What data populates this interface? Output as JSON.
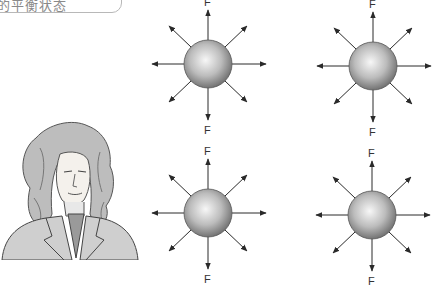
{
  "title_label": {
    "text": "的平衡状态",
    "cropped": true
  },
  "portrait": {
    "subject": "man-with-long-curly-wig-portrait",
    "style": "grayscale sketch"
  },
  "diagrams": [
    {
      "id": "sphere-top-left",
      "cx": 208,
      "cy": 64,
      "top_label": "F",
      "bottom_label": "F",
      "arrows": 8
    },
    {
      "id": "sphere-top-right",
      "cx": 373,
      "cy": 66,
      "top_label": "F",
      "bottom_label": "F",
      "arrows": 8
    },
    {
      "id": "sphere-bottom-left",
      "cx": 208,
      "cy": 213,
      "top_label": "F",
      "bottom_label": "F",
      "arrows": 8
    },
    {
      "id": "sphere-bottom-right",
      "cx": 372,
      "cy": 215,
      "top_label": "F",
      "bottom_label": "F",
      "arrows": 8
    }
  ],
  "colors": {
    "arrow": "#2a2a2a",
    "sphere_light": "#f2f2f2",
    "sphere_dark": "#7a7a7a",
    "label": "#333333"
  }
}
